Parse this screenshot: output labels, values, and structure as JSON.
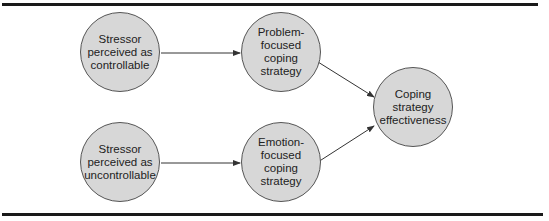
{
  "diagram": {
    "type": "flow",
    "colors": {
      "node_fill": "#d7d7d7",
      "node_border": "#555555",
      "edge": "#333333",
      "rule": "#1a1a1a"
    },
    "nodes": [
      {
        "id": "controllable",
        "label": "Stressor\nperceived as\ncontrollable"
      },
      {
        "id": "problem_focused",
        "label": "Problem-\nfocused\ncoping\nstrategy"
      },
      {
        "id": "effectiveness",
        "label": "Coping\nstrategy\neffectiveness"
      },
      {
        "id": "uncontrollable",
        "label": "Stressor\nperceived as\nuncontrollable"
      },
      {
        "id": "emotion_focused",
        "label": "Emotion-\nfocused\ncoping\nstrategy"
      }
    ],
    "edges": [
      {
        "from": "controllable",
        "to": "problem_focused"
      },
      {
        "from": "uncontrollable",
        "to": "emotion_focused"
      },
      {
        "from": "problem_focused",
        "to": "effectiveness"
      },
      {
        "from": "emotion_focused",
        "to": "effectiveness"
      }
    ]
  }
}
